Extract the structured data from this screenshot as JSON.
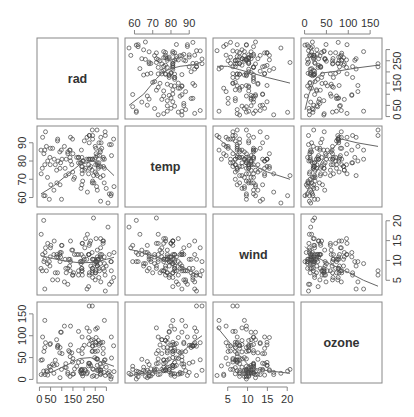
{
  "chart_data": {
    "type": "scatter",
    "title": "",
    "variant": "scatterplot-matrix with loess smoothers",
    "variables": [
      "rad",
      "temp",
      "wind",
      "ozone"
    ],
    "ranges": {
      "rad": [
        7,
        334
      ],
      "temp": [
        57,
        97
      ],
      "wind": [
        2.3,
        20.7
      ],
      "ozone": [
        1,
        168
      ]
    },
    "ticks": {
      "rad": {
        "values": [
          0,
          50,
          150,
          250
        ],
        "labels": [
          "0",
          "50",
          "150",
          "250"
        ],
        "side": "bottom-left, right-top",
        "alt_values": [
          0,
          50,
          150,
          250
        ]
      },
      "temp": {
        "values": [
          60,
          70,
          80,
          90
        ],
        "labels": [
          "60",
          "70",
          "80",
          "90"
        ]
      },
      "wind": {
        "values": [
          5,
          10,
          15,
          20
        ],
        "labels": [
          "5",
          "10",
          "15",
          "20"
        ]
      },
      "ozone": {
        "values": [
          0,
          50,
          100,
          150
        ],
        "labels": [
          "0",
          "50",
          "100",
          "150"
        ]
      }
    },
    "axis_placement": {
      "top": [
        {
          "col": 1,
          "var": "temp"
        },
        {
          "col": 3,
          "var": "ozone"
        }
      ],
      "bottom": [
        {
          "col": 0,
          "var": "rad"
        },
        {
          "col": 2,
          "var": "wind"
        }
      ],
      "left": [
        {
          "row": 1,
          "var": "temp"
        },
        {
          "row": 3,
          "var": "ozone"
        }
      ],
      "right": [
        {
          "row": 0,
          "var": "rad"
        },
        {
          "row": 2,
          "var": "wind"
        }
      ]
    },
    "points": {
      "rad": [
        190,
        118,
        149,
        313,
        299,
        99,
        19,
        194,
        256,
        290,
        274,
        65,
        334,
        307,
        78,
        322,
        44,
        8,
        320,
        25,
        92,
        66,
        266,
        13,
        252,
        223,
        279,
        286,
        287,
        242,
        186,
        220,
        264,
        127,
        273,
        291,
        323,
        259,
        250,
        148,
        332,
        322,
        191,
        284,
        37,
        120,
        137,
        150,
        59,
        91,
        250,
        135,
        127,
        47,
        98,
        31,
        138,
        269,
        248,
        236,
        101,
        175,
        314,
        276,
        267,
        272,
        175,
        139,
        264,
        175,
        291,
        48,
        260,
        274,
        285,
        187,
        220,
        7,
        258,
        295,
        294,
        223,
        81,
        82,
        213,
        275,
        253,
        254,
        83,
        24,
        77,
        255,
        229,
        207,
        192,
        273,
        157,
        71,
        51,
        115,
        244,
        190,
        259,
        36,
        212,
        238,
        215,
        153,
        203,
        225,
        237,
        188,
        167,
        197,
        183,
        189,
        95,
        92,
        252,
        220,
        230,
        259,
        236,
        259,
        238,
        24,
        112,
        237,
        224,
        27,
        238,
        201,
        238,
        14,
        139,
        49,
        20,
        193,
        145,
        191,
        131,
        223
      ],
      "temp": [
        67,
        72,
        74,
        62,
        65,
        59,
        61,
        69,
        66,
        68,
        58,
        64,
        66,
        57,
        68,
        62,
        59,
        73,
        61,
        61,
        67,
        81,
        79,
        76,
        82,
        90,
        87,
        82,
        77,
        72,
        65,
        73,
        76,
        84,
        85,
        81,
        83,
        83,
        88,
        92,
        92,
        89,
        73,
        81,
        80,
        81,
        82,
        84,
        87,
        85,
        74,
        86,
        85,
        82,
        86,
        88,
        86,
        83,
        81,
        81,
        81,
        82,
        89,
        90,
        90,
        86,
        82,
        80,
        77,
        79,
        76,
        78,
        78,
        77,
        72,
        79,
        81,
        86,
        97,
        94,
        96,
        94,
        91,
        92,
        93,
        93,
        87,
        84,
        80,
        78,
        75,
        73,
        81,
        76,
        77,
        71,
        71,
        78,
        67,
        76,
        68,
        82,
        64,
        71,
        81,
        69,
        63,
        70,
        75,
        76,
        68,
        86,
        82,
        80,
        79,
        77,
        79,
        76,
        78,
        78,
        77,
        72,
        75,
        79,
        81,
        86,
        88,
        97,
        94,
        96,
        94,
        91,
        92,
        93,
        93,
        87,
        84,
        80,
        78,
        75,
        73,
        81
      ],
      "wind": [
        7.4,
        8.0,
        12.6,
        11.5,
        8.6,
        13.8,
        20.1,
        9.7,
        9.2,
        10.9,
        13.2,
        11.5,
        12.0,
        18.4,
        11.5,
        9.7,
        9.7,
        16.6,
        9.7,
        12.0,
        12.0,
        14.9,
        5.7,
        7.4,
        9.7,
        13.8,
        11.5,
        8.0,
        14.9,
        20.7,
        9.2,
        11.5,
        10.3,
        4.0,
        9.2,
        9.2,
        4.6,
        10.9,
        5.1,
        6.3,
        5.7,
        7.4,
        14.3,
        14.9,
        14.3,
        6.9,
        10.3,
        6.3,
        5.1,
        11.5,
        6.9,
        8.6,
        8.0,
        8.6,
        12.0,
        7.4,
        7.4,
        7.4,
        9.2,
        6.9,
        13.8,
        7.4,
        4.0,
        10.3,
        8.0,
        11.5,
        11.5,
        9.7,
        10.3,
        6.3,
        7.4,
        10.9,
        10.3,
        15.5,
        14.3,
        9.7,
        3.4,
        8.0,
        9.7,
        2.3,
        6.3,
        6.3,
        6.9,
        5.1,
        2.8,
        4.6,
        7.4,
        15.5,
        10.9,
        10.3,
        10.9,
        9.7,
        14.9,
        15.5,
        6.3,
        10.9,
        11.5,
        6.9,
        13.8,
        10.3,
        10.3,
        8.0,
        12.6,
        9.2,
        10.3,
        10.3,
        16.6,
        6.9,
        13.2,
        14.3,
        8.0,
        11.5,
        11.5,
        10.9,
        9.7,
        8.0,
        10.9,
        9.7,
        6.9,
        11.5,
        8.6,
        8.6,
        12.0,
        8.6,
        5.7,
        2.8,
        4.6,
        7.4,
        6.9,
        13.2,
        10.3,
        10.3,
        8.0,
        11.5,
        14.9,
        13.2,
        9.7,
        14.3,
        12.6,
        7.4,
        10.3,
        11.5
      ],
      "ozone": [
        41,
        36,
        12,
        18,
        28,
        23,
        19,
        8,
        7,
        16,
        11,
        14,
        18,
        14,
        34,
        6,
        30,
        11,
        1,
        11,
        4,
        32,
        23,
        45,
        115,
        37,
        29,
        71,
        39,
        23,
        21,
        37,
        20,
        12,
        13,
        135,
        49,
        32,
        64,
        40,
        77,
        97,
        97,
        85,
        10,
        27,
        7,
        48,
        35,
        61,
        79,
        63,
        16,
        80,
        108,
        20,
        52,
        82,
        50,
        64,
        59,
        39,
        9,
        16,
        78,
        35,
        66,
        122,
        89,
        110,
        44,
        28,
        65,
        22,
        59,
        23,
        31,
        44,
        21,
        9,
        45,
        168,
        73,
        76,
        118,
        84,
        85,
        96,
        78,
        73,
        91,
        47,
        32,
        20,
        23,
        21,
        24,
        44,
        21,
        28,
        9,
        13,
        46,
        18,
        13,
        24,
        16,
        13,
        23,
        36,
        7,
        14,
        30,
        14,
        18,
        20,
        108,
        73,
        85,
        96,
        89,
        118,
        91,
        47,
        65,
        135,
        122,
        168,
        110,
        84,
        76,
        78,
        77,
        97,
        79,
        82,
        64,
        71,
        61,
        59,
        66,
        80
      ]
    },
    "smoothers": {
      "temp~rad": [
        [
          7,
          62
        ],
        [
          60,
          66
        ],
        [
          120,
          72
        ],
        [
          180,
          78
        ],
        [
          240,
          80
        ],
        [
          300,
          76
        ],
        [
          334,
          72
        ]
      ],
      "rad~temp": [
        [
          57,
          50
        ],
        [
          65,
          100
        ],
        [
          72,
          170
        ],
        [
          76,
          200
        ],
        [
          80,
          215
        ],
        [
          85,
          225
        ],
        [
          92,
          232
        ],
        [
          97,
          245
        ]
      ],
      "wind~rad": [
        [
          7,
          11.2
        ],
        [
          60,
          10.5
        ],
        [
          120,
          9.8
        ],
        [
          180,
          9.4
        ],
        [
          240,
          9.5
        ],
        [
          300,
          10.3
        ],
        [
          334,
          10.8
        ]
      ],
      "rad~wind": [
        [
          2.3,
          225
        ],
        [
          5,
          225
        ],
        [
          8,
          210
        ],
        [
          10,
          200
        ],
        [
          12,
          190
        ],
        [
          15,
          175
        ],
        [
          20.7,
          150
        ]
      ],
      "ozone~rad": [
        [
          7,
          10
        ],
        [
          60,
          18
        ],
        [
          120,
          32
        ],
        [
          180,
          48
        ],
        [
          230,
          50
        ],
        [
          280,
          40
        ],
        [
          334,
          30
        ]
      ],
      "rad~ozone": [
        [
          1,
          30
        ],
        [
          10,
          100
        ],
        [
          25,
          170
        ],
        [
          40,
          195
        ],
        [
          80,
          205
        ],
        [
          120,
          218
        ],
        [
          168,
          230
        ]
      ],
      "wind~temp": [
        [
          57,
          12.8
        ],
        [
          62,
          12.3
        ],
        [
          68,
          11.5
        ],
        [
          74,
          10.5
        ],
        [
          80,
          9.5
        ],
        [
          86,
          8.5
        ],
        [
          92,
          7.0
        ],
        [
          97,
          5.6
        ]
      ],
      "temp~wind": [
        [
          2.3,
          93
        ],
        [
          5,
          88
        ],
        [
          8,
          82
        ],
        [
          10,
          79
        ],
        [
          12,
          77
        ],
        [
          15,
          74
        ],
        [
          20.7,
          70
        ]
      ],
      "ozone~temp": [
        [
          57,
          8
        ],
        [
          62,
          12
        ],
        [
          68,
          16
        ],
        [
          74,
          20
        ],
        [
          80,
          35
        ],
        [
          86,
          62
        ],
        [
          92,
          85
        ],
        [
          97,
          100
        ]
      ],
      "temp~ozone": [
        [
          1,
          60
        ],
        [
          10,
          66
        ],
        [
          25,
          73
        ],
        [
          40,
          80
        ],
        [
          65,
          87
        ],
        [
          85,
          92
        ],
        [
          120,
          90
        ],
        [
          168,
          88
        ]
      ],
      "ozone~wind": [
        [
          2.3,
          120
        ],
        [
          5,
          90
        ],
        [
          8,
          55
        ],
        [
          10,
          35
        ],
        [
          12,
          25
        ],
        [
          15,
          20
        ],
        [
          20.7,
          14
        ]
      ],
      "wind~ozone": [
        [
          1,
          13.5
        ],
        [
          10,
          12.5
        ],
        [
          25,
          11
        ],
        [
          45,
          9.8
        ],
        [
          70,
          8.5
        ],
        [
          100,
          7
        ],
        [
          135,
          5
        ],
        [
          168,
          3.5
        ]
      ]
    },
    "grid": false,
    "legend": null
  }
}
